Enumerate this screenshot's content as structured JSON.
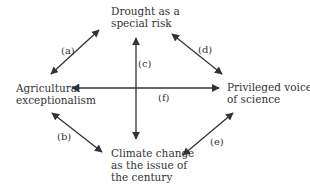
{
  "nodes": {
    "top": [
      "Drought as a",
      "special risk"
    ],
    "left": [
      "Agricultural",
      "exceptionalism"
    ],
    "right": [
      "Privileged voice",
      "of science"
    ],
    "bottom": [
      "Climate change",
      "as the issue of",
      "the century"
    ]
  },
  "edges": {
    "a": "(a)",
    "b": "(b)",
    "c": "(c)",
    "d": "(d)",
    "e": "(e)",
    "f": "(f)"
  },
  "colors": {
    "line": "#333333",
    "text": "#333333"
  }
}
